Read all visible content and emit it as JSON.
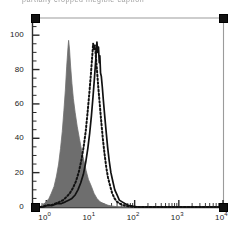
{
  "header": {
    "cropped_text": "partially cropped illegible caption"
  },
  "chart_data": {
    "type": "line",
    "title": "",
    "xlabel": "",
    "ylabel": "",
    "xscale": "log",
    "xlim": [
      0.5,
      10000
    ],
    "ylim": [
      0,
      110
    ],
    "x_tick_labels": [
      "10",
      "10",
      "10",
      "10",
      "10"
    ],
    "x_tick_exponents": [
      "0",
      "1",
      "2",
      "3",
      "4"
    ],
    "x_tick_values": [
      1,
      10,
      100,
      1000,
      10000
    ],
    "y_ticks": [
      0,
      20,
      40,
      60,
      80,
      100
    ],
    "y_tick_labels": [
      "0",
      "20",
      "40",
      "60",
      "80",
      "100"
    ],
    "grid": false,
    "legend": "none",
    "series": [
      {
        "name": "filled-gray-histogram",
        "style": "filled",
        "color": "#6e6e6e",
        "peak_x": 3.2,
        "peak_y": 97,
        "points": [
          [
            0.6,
            0
          ],
          [
            0.7,
            0
          ],
          [
            0.8,
            1
          ],
          [
            0.9,
            2
          ],
          [
            1.0,
            3
          ],
          [
            1.15,
            5
          ],
          [
            1.3,
            8
          ],
          [
            1.5,
            12
          ],
          [
            1.7,
            18
          ],
          [
            1.9,
            25
          ],
          [
            2.1,
            34
          ],
          [
            2.3,
            44
          ],
          [
            2.5,
            56
          ],
          [
            2.7,
            68
          ],
          [
            2.9,
            82
          ],
          [
            3.1,
            93
          ],
          [
            3.2,
            97
          ],
          [
            3.35,
            92
          ],
          [
            3.55,
            82
          ],
          [
            3.8,
            72
          ],
          [
            4.1,
            63
          ],
          [
            4.5,
            55
          ],
          [
            5.0,
            47
          ],
          [
            5.6,
            40
          ],
          [
            6.3,
            33
          ],
          [
            7.1,
            27
          ],
          [
            8.0,
            21
          ],
          [
            9.0,
            16
          ],
          [
            10.5,
            12
          ],
          [
            12.0,
            8
          ],
          [
            14.0,
            5
          ],
          [
            16.5,
            3
          ],
          [
            20.0,
            2
          ],
          [
            25.0,
            1
          ],
          [
            32.0,
            0.5
          ],
          [
            45.0,
            0
          ],
          [
            10000,
            0
          ]
        ]
      },
      {
        "name": "dotted-line-histogram",
        "style": "dotted",
        "color": "#111111",
        "peak_x": 11.5,
        "peak_y": 95,
        "points": [
          [
            0.6,
            0
          ],
          [
            0.8,
            0
          ],
          [
            1.0,
            1
          ],
          [
            1.3,
            1
          ],
          [
            1.6,
            2
          ],
          [
            2.0,
            3
          ],
          [
            2.4,
            4
          ],
          [
            2.9,
            6
          ],
          [
            3.4,
            8
          ],
          [
            4.0,
            11
          ],
          [
            4.7,
            15
          ],
          [
            5.4,
            20
          ],
          [
            6.2,
            27
          ],
          [
            7.0,
            35
          ],
          [
            7.8,
            44
          ],
          [
            8.6,
            55
          ],
          [
            9.4,
            66
          ],
          [
            10.2,
            77
          ],
          [
            10.9,
            87
          ],
          [
            11.5,
            95
          ],
          [
            12.0,
            92
          ],
          [
            12.6,
            94
          ],
          [
            13.2,
            88
          ],
          [
            14.0,
            80
          ],
          [
            15.0,
            70
          ],
          [
            16.2,
            60
          ],
          [
            17.5,
            50
          ],
          [
            19.0,
            40
          ],
          [
            20.8,
            31
          ],
          [
            22.8,
            23
          ],
          [
            25.0,
            17
          ],
          [
            28.0,
            12
          ],
          [
            31.0,
            8
          ],
          [
            35.0,
            5
          ],
          [
            40.0,
            3
          ],
          [
            46.0,
            2
          ],
          [
            55.0,
            1
          ],
          [
            70.0,
            0.5
          ],
          [
            95.0,
            0
          ],
          [
            10000,
            0
          ]
        ]
      },
      {
        "name": "solid-line-histogram",
        "style": "solid",
        "color": "#111111",
        "peak_x": 14.0,
        "peak_y": 96,
        "points": [
          [
            0.6,
            0
          ],
          [
            0.85,
            0
          ],
          [
            1.1,
            1
          ],
          [
            1.4,
            1
          ],
          [
            1.8,
            2
          ],
          [
            2.2,
            2
          ],
          [
            2.7,
            3
          ],
          [
            3.2,
            4
          ],
          [
            3.8,
            5
          ],
          [
            4.5,
            7
          ],
          [
            5.2,
            10
          ],
          [
            6.0,
            14
          ],
          [
            6.9,
            19
          ],
          [
            7.8,
            26
          ],
          [
            8.7,
            34
          ],
          [
            9.6,
            43
          ],
          [
            10.5,
            53
          ],
          [
            11.4,
            64
          ],
          [
            12.3,
            75
          ],
          [
            13.2,
            86
          ],
          [
            14.0,
            96
          ],
          [
            14.6,
            90
          ],
          [
            15.2,
            93
          ],
          [
            15.8,
            84
          ],
          [
            16.3,
            88
          ],
          [
            16.9,
            78
          ],
          [
            17.6,
            76
          ],
          [
            18.5,
            70
          ],
          [
            19.6,
            62
          ],
          [
            21.0,
            53
          ],
          [
            22.6,
            44
          ],
          [
            24.4,
            35
          ],
          [
            26.5,
            27
          ],
          [
            29.0,
            20
          ],
          [
            32.0,
            15
          ],
          [
            35.5,
            10
          ],
          [
            40.0,
            7
          ],
          [
            45.0,
            4
          ],
          [
            52.0,
            3
          ],
          [
            60.0,
            2
          ],
          [
            72.0,
            1
          ],
          [
            90.0,
            0.5
          ],
          [
            120.0,
            0
          ],
          [
            10000,
            0
          ]
        ]
      }
    ],
    "gate_markers": [
      {
        "name": "top-left-gate-handle",
        "x": 1,
        "y": 110
      },
      {
        "name": "top-right-gate-handle",
        "x": 10000,
        "y": 110
      },
      {
        "name": "bottom-left-gate-handle",
        "x": 1,
        "y": 0
      },
      {
        "name": "bottom-right-gate-handle",
        "x": 10000,
        "y": 0
      }
    ],
    "colors": {
      "fill": "#6e6e6e",
      "line": "#111111",
      "axis": "#2a2a2a",
      "gate_line": "#9b9b9b"
    }
  }
}
